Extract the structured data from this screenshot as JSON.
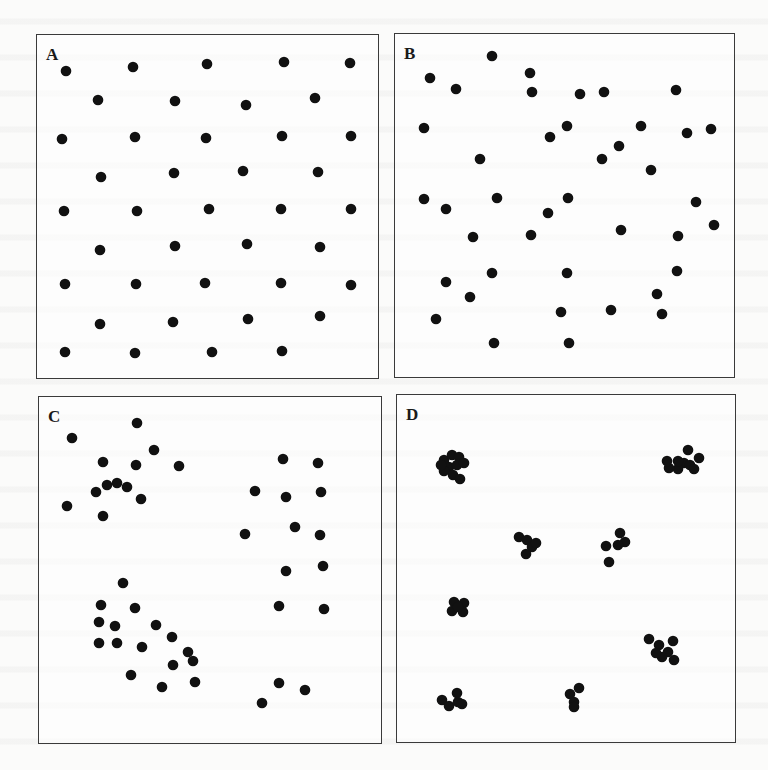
{
  "figure": {
    "dot_color": "#111111",
    "dot_radius": 5.3,
    "panels": [
      {
        "id": "A",
        "label": "A",
        "box": {
          "x": 36,
          "y": 34,
          "w": 343,
          "h": 345
        },
        "points": [
          [
            29,
            36
          ],
          [
            96,
            32
          ],
          [
            170,
            29
          ],
          [
            247,
            27
          ],
          [
            313,
            28
          ],
          [
            61,
            65
          ],
          [
            138,
            66
          ],
          [
            209,
            70
          ],
          [
            278,
            63
          ],
          [
            25,
            104
          ],
          [
            98,
            102
          ],
          [
            169,
            103
          ],
          [
            245,
            101
          ],
          [
            314,
            101
          ],
          [
            64,
            142
          ],
          [
            137,
            138
          ],
          [
            206,
            136
          ],
          [
            281,
            137
          ],
          [
            27,
            176
          ],
          [
            100,
            176
          ],
          [
            172,
            174
          ],
          [
            244,
            174
          ],
          [
            314,
            174
          ],
          [
            63,
            215
          ],
          [
            138,
            211
          ],
          [
            210,
            209
          ],
          [
            283,
            212
          ],
          [
            28,
            249
          ],
          [
            99,
            249
          ],
          [
            168,
            248
          ],
          [
            244,
            248
          ],
          [
            314,
            250
          ],
          [
            63,
            289
          ],
          [
            136,
            287
          ],
          [
            211,
            284
          ],
          [
            283,
            281
          ],
          [
            28,
            317
          ],
          [
            98,
            318
          ],
          [
            175,
            317
          ],
          [
            245,
            316
          ]
        ]
      },
      {
        "id": "B",
        "label": "B",
        "box": {
          "x": 394,
          "y": 33,
          "w": 341,
          "h": 345
        },
        "points": [
          [
            97,
            22
          ],
          [
            35,
            44
          ],
          [
            61,
            55
          ],
          [
            135,
            39
          ],
          [
            137,
            58
          ],
          [
            185,
            60
          ],
          [
            209,
            58
          ],
          [
            281,
            56
          ],
          [
            29,
            94
          ],
          [
            155,
            103
          ],
          [
            172,
            92
          ],
          [
            246,
            92
          ],
          [
            292,
            99
          ],
          [
            316,
            95
          ],
          [
            224,
            112
          ],
          [
            207,
            125
          ],
          [
            85,
            125
          ],
          [
            256,
            136
          ],
          [
            29,
            165
          ],
          [
            102,
            164
          ],
          [
            173,
            164
          ],
          [
            301,
            168
          ],
          [
            51,
            175
          ],
          [
            153,
            179
          ],
          [
            226,
            196
          ],
          [
            319,
            191
          ],
          [
            283,
            202
          ],
          [
            78,
            203
          ],
          [
            136,
            201
          ],
          [
            97,
            239
          ],
          [
            172,
            239
          ],
          [
            282,
            237
          ],
          [
            51,
            248
          ],
          [
            75,
            263
          ],
          [
            262,
            260
          ],
          [
            267,
            280
          ],
          [
            166,
            278
          ],
          [
            216,
            276
          ],
          [
            41,
            285
          ],
          [
            99,
            309
          ],
          [
            174,
            309
          ]
        ]
      },
      {
        "id": "C",
        "label": "C",
        "box": {
          "x": 38,
          "y": 396,
          "w": 344,
          "h": 348
        },
        "points": [
          [
            98,
            26
          ],
          [
            33,
            41
          ],
          [
            115,
            53
          ],
          [
            64,
            65
          ],
          [
            97,
            68
          ],
          [
            140,
            69
          ],
          [
            68,
            88
          ],
          [
            78,
            86
          ],
          [
            88,
            90
          ],
          [
            57,
            95
          ],
          [
            102,
            102
          ],
          [
            28,
            109
          ],
          [
            64,
            119
          ],
          [
            244,
            62
          ],
          [
            279,
            66
          ],
          [
            216,
            94
          ],
          [
            247,
            100
          ],
          [
            282,
            95
          ],
          [
            256,
            130
          ],
          [
            206,
            137
          ],
          [
            281,
            138
          ],
          [
            247,
            174
          ],
          [
            284,
            169
          ],
          [
            240,
            209
          ],
          [
            285,
            212
          ],
          [
            84,
            186
          ],
          [
            62,
            208
          ],
          [
            96,
            211
          ],
          [
            60,
            225
          ],
          [
            76,
            229
          ],
          [
            117,
            228
          ],
          [
            60,
            246
          ],
          [
            78,
            246
          ],
          [
            103,
            250
          ],
          [
            133,
            240
          ],
          [
            149,
            255
          ],
          [
            154,
            264
          ],
          [
            134,
            268
          ],
          [
            92,
            278
          ],
          [
            123,
            290
          ],
          [
            156,
            285
          ],
          [
            240,
            286
          ],
          [
            266,
            293
          ],
          [
            223,
            306
          ]
        ]
      },
      {
        "id": "D",
        "label": "D",
        "box": {
          "x": 396,
          "y": 394,
          "w": 340,
          "h": 349
        },
        "points": [
          [
            47,
            65
          ],
          [
            55,
            60
          ],
          [
            62,
            62
          ],
          [
            52,
            72
          ],
          [
            60,
            70
          ],
          [
            67,
            68
          ],
          [
            47,
            76
          ],
          [
            56,
            80
          ],
          [
            63,
            84
          ],
          [
            44,
            70
          ],
          [
            291,
            55
          ],
          [
            287,
            68
          ],
          [
            281,
            74
          ],
          [
            272,
            73
          ],
          [
            281,
            66
          ],
          [
            293,
            70
          ],
          [
            302,
            63
          ],
          [
            297,
            74
          ],
          [
            270,
            66
          ],
          [
            122,
            142
          ],
          [
            130,
            145
          ],
          [
            135,
            152
          ],
          [
            129,
            159
          ],
          [
            139,
            148
          ],
          [
            223,
            138
          ],
          [
            228,
            147
          ],
          [
            221,
            150
          ],
          [
            209,
            151
          ],
          [
            212,
            167
          ],
          [
            57,
            207
          ],
          [
            67,
            208
          ],
          [
            55,
            216
          ],
          [
            66,
            217
          ],
          [
            61,
            212
          ],
          [
            252,
            244
          ],
          [
            262,
            250
          ],
          [
            271,
            257
          ],
          [
            276,
            246
          ],
          [
            265,
            262
          ],
          [
            277,
            265
          ],
          [
            259,
            258
          ],
          [
            173,
            299
          ],
          [
            182,
            293
          ],
          [
            177,
            307
          ],
          [
            177,
            312
          ],
          [
            45,
            305
          ],
          [
            52,
            311
          ],
          [
            61,
            307
          ],
          [
            60,
            298
          ],
          [
            65,
            309
          ]
        ]
      }
    ]
  }
}
